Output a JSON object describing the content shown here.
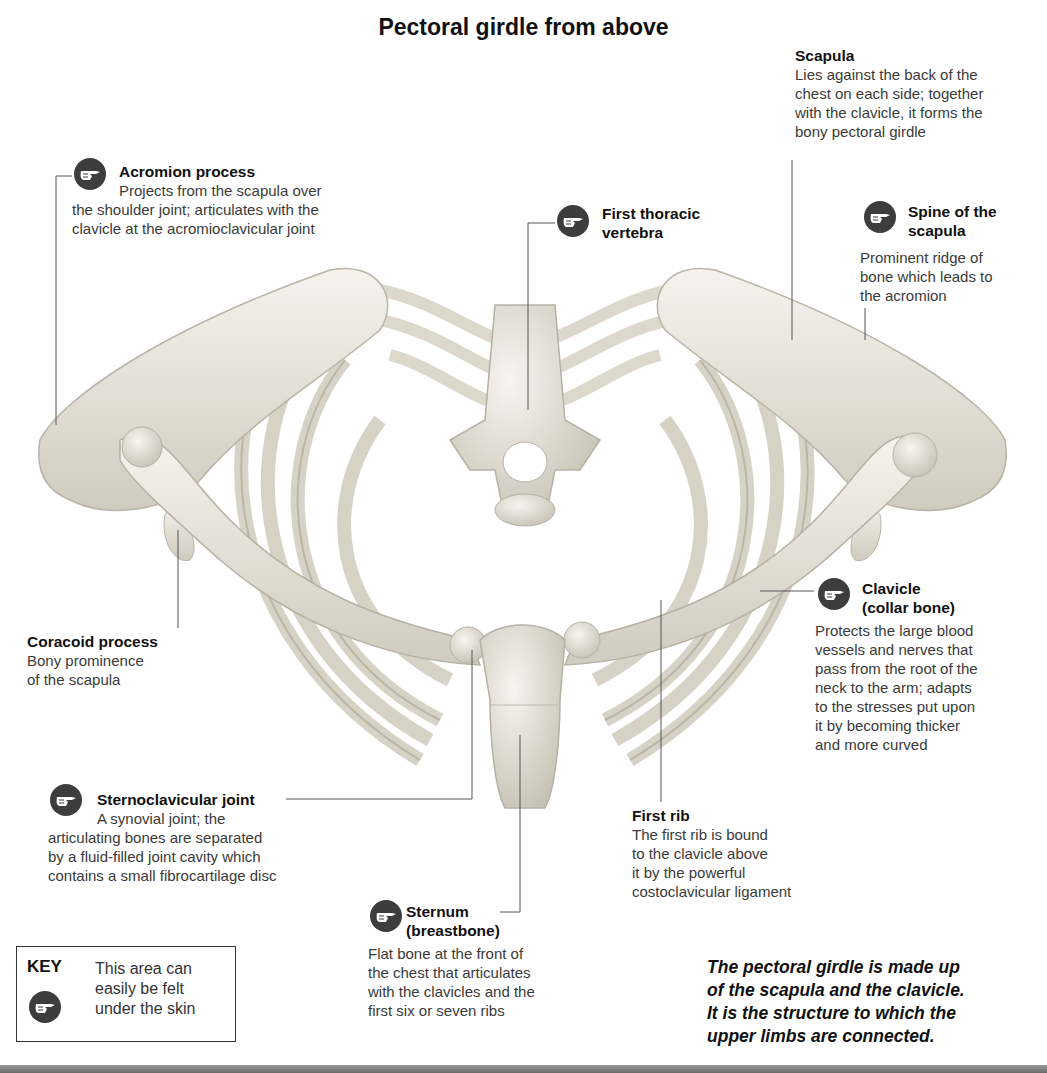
{
  "title": "Pectoral girdle from above",
  "labels": {
    "acromion": {
      "heading": "Acromion process",
      "desc_lines": [
        "Projects from the scapula over",
        "the shoulder joint; articulates with the",
        "clavicle at the acromioclavicular joint"
      ],
      "palpable": true
    },
    "scapula": {
      "heading": "Scapula",
      "desc_lines": [
        "Lies against the back of the",
        "chest on each side; together",
        "with the clavicle, it forms the",
        "bony pectoral girdle"
      ],
      "palpable": false
    },
    "first_thoracic": {
      "heading_lines": [
        "First thoracic",
        "vertebra"
      ],
      "palpable": true
    },
    "spine_scapula": {
      "heading_lines": [
        "Spine of the",
        "scapula"
      ],
      "desc_lines": [
        "Prominent ridge of",
        "bone which leads to",
        "the acromion"
      ],
      "palpable": true
    },
    "coracoid": {
      "heading": "Coracoid process",
      "desc_lines": [
        "Bony prominence",
        "of the scapula"
      ],
      "palpable": false
    },
    "clavicle": {
      "heading_lines": [
        "Clavicle",
        "(collar bone)"
      ],
      "desc_lines": [
        "Protects the large blood",
        "vessels and nerves that",
        "pass from the root of the",
        "neck to the arm; adapts",
        "to the stresses put upon",
        "it by becoming thicker",
        "and more curved"
      ],
      "palpable": true
    },
    "sternoclavicular": {
      "heading": "Sternoclavicular joint",
      "desc_lines": [
        "A synovial joint; the",
        "articulating bones are separated",
        "by a fluid-filled joint cavity which",
        "contains a small fibrocartilage disc"
      ],
      "palpable": true
    },
    "first_rib": {
      "heading": "First rib",
      "desc_lines": [
        "The first rib is bound",
        "to the clavicle above",
        "it by the powerful",
        "costoclavicular ligament"
      ],
      "palpable": false
    },
    "sternum": {
      "heading_lines": [
        "Sternum",
        "(breastbone)"
      ],
      "desc_lines": [
        "Flat bone at the front of",
        "the chest that articulates",
        "with the clavicles and the",
        "first six or seven ribs"
      ],
      "palpable": true
    }
  },
  "key": {
    "title": "KEY",
    "text_lines": [
      "This area can",
      "easily be felt",
      "under the skin"
    ],
    "icon": "pointing-hand-icon"
  },
  "summary_lines": [
    "The pectoral girdle is made up",
    "of the scapula and the clavicle.",
    "It is the structure to which the",
    "upper limbs are connected."
  ],
  "colors": {
    "bone": "#ece9de",
    "bone_shade": "#c9c5b8",
    "icon_bg": "#3d3d3d",
    "text": "#333333",
    "heading": "#111111"
  }
}
